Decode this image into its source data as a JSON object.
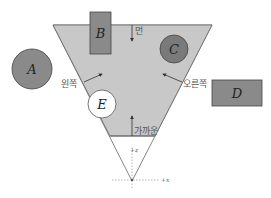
{
  "diagram": {
    "frustum": {
      "fill": "#c8c8c8",
      "near_fill": "#ffffff",
      "edge_color": "#555555",
      "planes": {
        "far": "먼",
        "left": "왼쪽",
        "right": "오른쪽",
        "near": "가까운"
      }
    },
    "objects": [
      {
        "id": "A",
        "shape": "circle",
        "fill": "#8a8a8a",
        "state": "outside"
      },
      {
        "id": "B",
        "shape": "rect",
        "fill": "#8a8a8a",
        "state": "intersecting"
      },
      {
        "id": "C",
        "shape": "circle",
        "fill": "#7a7a7a",
        "state": "inside"
      },
      {
        "id": "D",
        "shape": "rect",
        "fill": "#8a8a8a",
        "state": "outside"
      },
      {
        "id": "E",
        "shape": "circle",
        "fill": "#ffffff",
        "state": "intersecting"
      }
    ],
    "axes": {
      "z_label": "+z",
      "x_label": "+x"
    }
  }
}
